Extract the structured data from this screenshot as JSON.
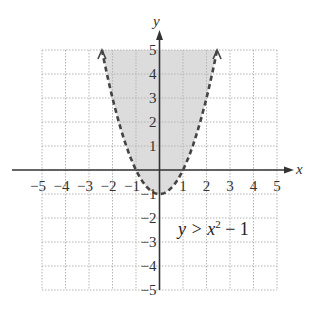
{
  "chart_data": {
    "type": "line",
    "title": "",
    "xlabel": "x",
    "ylabel": "y",
    "xlim": [
      -5,
      5
    ],
    "ylim": [
      -5,
      5
    ],
    "grid": true,
    "x_ticks": [
      "-5",
      "-4",
      "-3",
      "-2",
      "-1",
      "1",
      "2",
      "3",
      "4",
      "5"
    ],
    "y_ticks": [
      "5",
      "4",
      "3",
      "2",
      "1",
      "-1",
      "-2",
      "-3",
      "-4",
      "-5"
    ],
    "series": [
      {
        "name": "boundary y = x^2 - 1",
        "style": "dashed",
        "function": "x^2 - 1",
        "x": [
          -2.45,
          -2,
          -1.5,
          -1,
          -0.5,
          0,
          0.5,
          1,
          1.5,
          2,
          2.45
        ],
        "y": [
          5.0,
          3,
          1.25,
          0,
          -0.75,
          -1,
          -0.75,
          0,
          1.25,
          3,
          5.0
        ]
      }
    ],
    "shaded_region": "y > x^2 - 1 (inside the parabola)",
    "annotations": [
      {
        "text": "y > x² − 1",
        "x": 2.6,
        "y": -2.2
      }
    ]
  },
  "labels": {
    "x_axis": "x",
    "y_axis": "y",
    "inequality_lhs": "y > x",
    "inequality_exp": "2",
    "inequality_rhs": " − 1"
  },
  "colors": {
    "shade": "#dcdcdc",
    "grid": "#b5b5b5",
    "axis": "#333333",
    "curve": "#444444"
  }
}
